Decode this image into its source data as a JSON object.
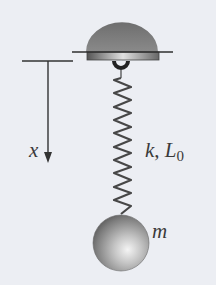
{
  "diagram": {
    "type": "spring-mass system",
    "labels": {
      "displacement": "x",
      "spring_constant": "k",
      "separator": ", ",
      "natural_length_base": "L",
      "natural_length_subscript": "0",
      "mass": "m"
    },
    "elements": [
      "ceiling-mount-dome",
      "hook",
      "spring",
      "reference-line",
      "displacement-arrow",
      "mass-ball"
    ],
    "colors": {
      "background": "#eceef3",
      "dome": "#7a7a7a",
      "line": "#333333",
      "spring": "#4a4a4a",
      "ball": "#9a9a9a"
    }
  }
}
